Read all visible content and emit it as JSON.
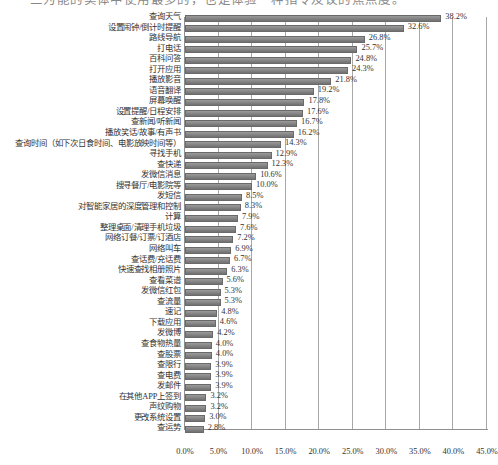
{
  "page": {
    "top_cut_text": "三为能的实体中使用最多的，也是体验一种指令及议的焦点度。"
  },
  "chart_data": {
    "type": "bar",
    "orientation": "horizontal",
    "title": "",
    "xlabel": "",
    "ylabel": "",
    "xlim": [
      0,
      45
    ],
    "xticks": [
      "0.0%",
      "5.0%",
      "10.0%",
      "15.0%",
      "20.0%",
      "25.0%",
      "30.0%",
      "35.0%",
      "40.0%",
      "45.0%"
    ],
    "xtick_values": [
      0,
      5,
      10,
      15,
      20,
      25,
      30,
      35,
      40,
      45
    ],
    "grid": true,
    "legend": null,
    "value_suffix": "%",
    "bar_color": "#8a8a8a",
    "categories": [
      "查询天气",
      "设置闹钟/倒计时提醒",
      "路线导航",
      "打电话",
      "百科问答",
      "打开应用",
      "播放影音",
      "语音翻译",
      "屏幕唤醒",
      "设置提醒/日程安排",
      "查新闻/听新闻",
      "播放笑话/故事/有声书",
      "查询时间（如下次日食时间、电影放映时间等）",
      "寻找手机",
      "查快递",
      "发微信消息",
      "搜寻餐厅/电影院等",
      "发短信",
      "对智能家居的深度管理和控制",
      "计算",
      "整理桌面/清理手机垃圾",
      "网络订餐/订票/订酒店",
      "网络叫车",
      "查话费/充话费",
      "快速查找相册照片",
      "查看菜谱",
      "发微信红包",
      "查流量",
      "速记",
      "下载应用",
      "发微博",
      "查食物热量",
      "查股票",
      "查限行",
      "查电费",
      "发邮件",
      "在其他APP上签到",
      "声纹购物",
      "更改系统设置",
      "查运势"
    ],
    "values": [
      38.2,
      32.6,
      26.8,
      25.7,
      24.8,
      24.3,
      21.8,
      19.2,
      17.8,
      17.6,
      16.7,
      16.2,
      14.3,
      12.9,
      12.3,
      10.6,
      10.0,
      8.5,
      8.3,
      7.9,
      7.6,
      7.2,
      6.9,
      6.7,
      6.3,
      5.6,
      5.3,
      5.3,
      4.8,
      4.6,
      4.2,
      4.0,
      4.0,
      3.9,
      3.9,
      3.9,
      3.2,
      3.2,
      3.0,
      2.8
    ],
    "value_labels": [
      "38.2%",
      "32.6%",
      "26.8%",
      "25.7%",
      "24.8%",
      "24.3%",
      "21.8%",
      "19.2%",
      "17.8%",
      "17.6%",
      "16.7%",
      "16.2%",
      "14.3%",
      "12.9%",
      "12.3%",
      "10.6%",
      "10.0%",
      "8.5%",
      "8.3%",
      "7.9%",
      "7.6%",
      "7.2%",
      "6.9%",
      "6.7%",
      "6.3%",
      "5.6%",
      "5.3%",
      "5.3%",
      "4.8%",
      "4.6%",
      "4.2%",
      "4.0%",
      "4.0%",
      "3.9%",
      "3.9%",
      "3.9%",
      "3.2%",
      "3.2%",
      "3.0%",
      "2.8%"
    ]
  }
}
